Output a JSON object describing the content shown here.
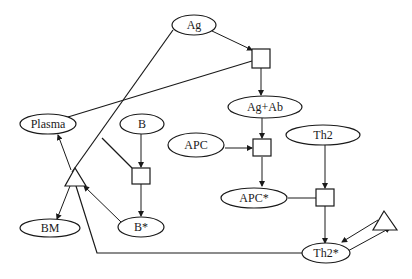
{
  "diagram": {
    "nodes": {
      "ag": {
        "label": "Ag",
        "shape": "ellipse"
      },
      "ag_ab": {
        "label": "Ag+Ab",
        "shape": "ellipse"
      },
      "plasma": {
        "label": "Plasma",
        "shape": "ellipse"
      },
      "b": {
        "label": "B",
        "shape": "ellipse"
      },
      "apc": {
        "label": "APC",
        "shape": "ellipse"
      },
      "th2": {
        "label": "Th2",
        "shape": "ellipse"
      },
      "apc_star": {
        "label": "APC*",
        "shape": "ellipse"
      },
      "bm": {
        "label": "BM",
        "shape": "ellipse"
      },
      "b_star": {
        "label": "B*",
        "shape": "ellipse"
      },
      "th2_star": {
        "label": "Th2*",
        "shape": "ellipse"
      }
    },
    "transitions": [
      "ag-binding-box",
      "b-activation-box",
      "apc-activation-box",
      "th2-activation-box"
    ],
    "operators": [
      "differentiation-triangle",
      "th2-feedback-triangle"
    ],
    "colors": {
      "stroke": "#1a1a1a",
      "background": "#ffffff"
    }
  }
}
